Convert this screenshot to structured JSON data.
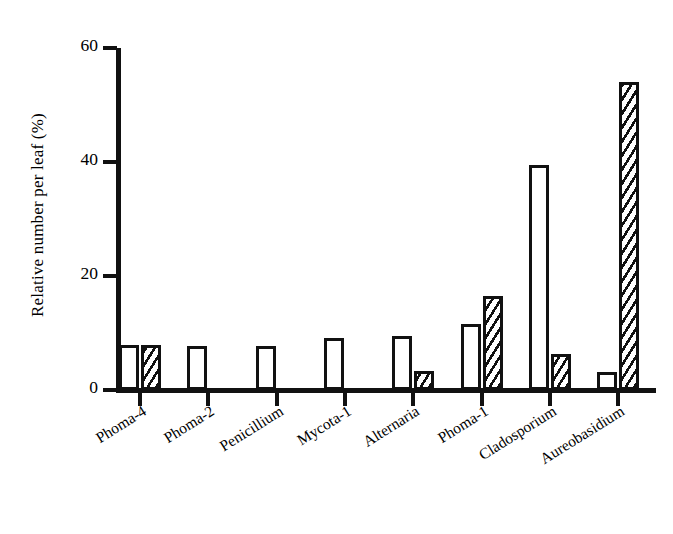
{
  "chart_data": {
    "type": "bar",
    "title": "",
    "subtitle": "",
    "xlabel": "",
    "ylabel": "Relative number per leaf (%)",
    "categories": [
      "Phoma-4",
      "Phoma-2",
      "Penicillium",
      "Mycota-1",
      "Alternaria",
      "Phoma-1",
      "Cladosporium",
      "Aureobasidium"
    ],
    "series": [
      {
        "name": "open-bar",
        "style": "open",
        "values": [
          7.9,
          7.8,
          7.7,
          9.2,
          9.5,
          11.5,
          39.5,
          3.2
        ]
      },
      {
        "name": "hatched-bar",
        "style": "hatched",
        "values": [
          7.9,
          0,
          0,
          0,
          3.3,
          16.5,
          6.3,
          54.0
        ]
      }
    ],
    "ylim": [
      0,
      60
    ],
    "yticks": [
      0,
      20,
      40,
      60
    ],
    "ytick_labels": [
      "0",
      "20",
      "40",
      "60"
    ],
    "grid": false,
    "legend": "none",
    "colors": {
      "axis": "#111111",
      "bar_outline": "#111111",
      "bar_fill_open": "#ffffff",
      "bar_fill_hatched": "#111111",
      "background": "#ffffff"
    }
  }
}
